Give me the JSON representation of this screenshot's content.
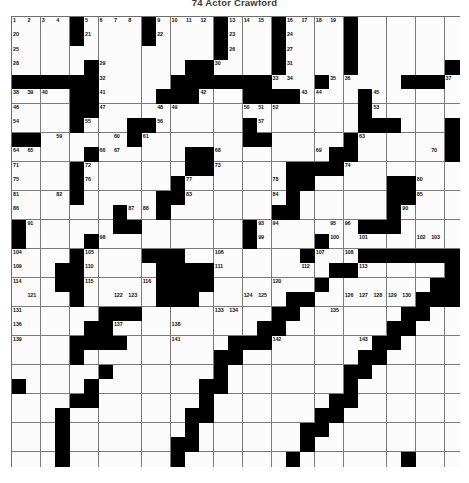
{
  "puzzle": {
    "title": "74  Actor Crawford",
    "type": "crossword-grid",
    "columns": 31,
    "rows": 31,
    "colors": {
      "block": "#000000",
      "cell": "#fbfbfb",
      "grid_line": "#7a7a7a",
      "number_text": "#111111",
      "page_background": "#ffffff"
    },
    "black_cells": [
      [
        0,
        4
      ],
      [
        0,
        9
      ],
      [
        0,
        14
      ],
      [
        0,
        18
      ],
      [
        0,
        23
      ],
      [
        1,
        4
      ],
      [
        1,
        9
      ],
      [
        1,
        14
      ],
      [
        1,
        18
      ],
      [
        1,
        23
      ],
      [
        2,
        14
      ],
      [
        2,
        18
      ],
      [
        2,
        23
      ],
      [
        3,
        5
      ],
      [
        3,
        12
      ],
      [
        3,
        13
      ],
      [
        3,
        18
      ],
      [
        3,
        23
      ],
      [
        3,
        30
      ],
      [
        4,
        0
      ],
      [
        4,
        1
      ],
      [
        4,
        2
      ],
      [
        4,
        3
      ],
      [
        4,
        4
      ],
      [
        4,
        5
      ],
      [
        4,
        11
      ],
      [
        4,
        12
      ],
      [
        4,
        13
      ],
      [
        4,
        14
      ],
      [
        4,
        15
      ],
      [
        4,
        16
      ],
      [
        4,
        17
      ],
      [
        4,
        21
      ],
      [
        4,
        27
      ],
      [
        4,
        28
      ],
      [
        4,
        29
      ],
      [
        5,
        4
      ],
      [
        5,
        5
      ],
      [
        5,
        10
      ],
      [
        5,
        11
      ],
      [
        5,
        12
      ],
      [
        5,
        16
      ],
      [
        5,
        17
      ],
      [
        5,
        18
      ],
      [
        5,
        19
      ],
      [
        5,
        24
      ],
      [
        6,
        4
      ],
      [
        6,
        5
      ],
      [
        6,
        24
      ],
      [
        7,
        4
      ],
      [
        7,
        8
      ],
      [
        7,
        9
      ],
      [
        7,
        16
      ],
      [
        7,
        24
      ],
      [
        7,
        25
      ],
      [
        7,
        26
      ],
      [
        7,
        30
      ],
      [
        8,
        0
      ],
      [
        8,
        1
      ],
      [
        8,
        8
      ],
      [
        8,
        16
      ],
      [
        8,
        17
      ],
      [
        8,
        23
      ],
      [
        8,
        30
      ],
      [
        9,
        5
      ],
      [
        9,
        12
      ],
      [
        9,
        13
      ],
      [
        9,
        22
      ],
      [
        9,
        23
      ],
      [
        9,
        30
      ],
      [
        10,
        4
      ],
      [
        10,
        12
      ],
      [
        10,
        13
      ],
      [
        10,
        19
      ],
      [
        10,
        20
      ],
      [
        10,
        21
      ],
      [
        10,
        22
      ],
      [
        11,
        4
      ],
      [
        11,
        11
      ],
      [
        11,
        19
      ],
      [
        11,
        20
      ],
      [
        11,
        26
      ],
      [
        11,
        27
      ],
      [
        12,
        4
      ],
      [
        12,
        10
      ],
      [
        12,
        11
      ],
      [
        12,
        19
      ],
      [
        12,
        26
      ],
      [
        12,
        27
      ],
      [
        13,
        7
      ],
      [
        13,
        10
      ],
      [
        13,
        18
      ],
      [
        13,
        19
      ],
      [
        13,
        26
      ],
      [
        14,
        0
      ],
      [
        14,
        7
      ],
      [
        14,
        8
      ],
      [
        14,
        16
      ],
      [
        14,
        24
      ],
      [
        14,
        25
      ],
      [
        14,
        26
      ],
      [
        15,
        0
      ],
      [
        15,
        5
      ],
      [
        15,
        16
      ],
      [
        15,
        21
      ],
      [
        16,
        4
      ],
      [
        16,
        9
      ],
      [
        16,
        10
      ],
      [
        16,
        11
      ],
      [
        16,
        20
      ],
      [
        16,
        24
      ],
      [
        16,
        25
      ],
      [
        16,
        26
      ],
      [
        16,
        27
      ],
      [
        16,
        28
      ],
      [
        16,
        29
      ],
      [
        16,
        30
      ],
      [
        17,
        3
      ],
      [
        17,
        4
      ],
      [
        17,
        10
      ],
      [
        17,
        11
      ],
      [
        17,
        12
      ],
      [
        17,
        13
      ],
      [
        17,
        22
      ],
      [
        17,
        23
      ],
      [
        17,
        30
      ],
      [
        18,
        3
      ],
      [
        18,
        4
      ],
      [
        18,
        10
      ],
      [
        18,
        11
      ],
      [
        18,
        12
      ],
      [
        18,
        13
      ],
      [
        18,
        21
      ],
      [
        18,
        29
      ],
      [
        18,
        30
      ],
      [
        19,
        4
      ],
      [
        19,
        10
      ],
      [
        19,
        11
      ],
      [
        19,
        12
      ],
      [
        19,
        19
      ],
      [
        19,
        20
      ],
      [
        19,
        28
      ],
      [
        19,
        29
      ],
      [
        19,
        30
      ],
      [
        20,
        6
      ],
      [
        20,
        7
      ],
      [
        20,
        8
      ],
      [
        20,
        18
      ],
      [
        20,
        19
      ],
      [
        20,
        27
      ],
      [
        20,
        28
      ],
      [
        21,
        5
      ],
      [
        21,
        6
      ],
      [
        21,
        17
      ],
      [
        21,
        18
      ],
      [
        21,
        26
      ],
      [
        21,
        27
      ],
      [
        22,
        4
      ],
      [
        22,
        5
      ],
      [
        22,
        6
      ],
      [
        22,
        7
      ],
      [
        22,
        15
      ],
      [
        22,
        16
      ],
      [
        22,
        17
      ],
      [
        22,
        25
      ],
      [
        22,
        26
      ],
      [
        23,
        4
      ],
      [
        23,
        14
      ],
      [
        23,
        15
      ],
      [
        23,
        24
      ],
      [
        23,
        25
      ],
      [
        24,
        6
      ],
      [
        24,
        14
      ],
      [
        24,
        23
      ],
      [
        24,
        24
      ],
      [
        25,
        0
      ],
      [
        25,
        5
      ],
      [
        25,
        13
      ],
      [
        25,
        14
      ],
      [
        25,
        23
      ],
      [
        26,
        4
      ],
      [
        26,
        5
      ],
      [
        26,
        13
      ],
      [
        26,
        22
      ],
      [
        26,
        23
      ],
      [
        27,
        3
      ],
      [
        27,
        12
      ],
      [
        27,
        13
      ],
      [
        27,
        21
      ],
      [
        27,
        22
      ],
      [
        28,
        3
      ],
      [
        28,
        12
      ],
      [
        28,
        20
      ],
      [
        28,
        21
      ],
      [
        29,
        3
      ],
      [
        29,
        11
      ],
      [
        29,
        12
      ],
      [
        29,
        20
      ],
      [
        30,
        3
      ],
      [
        30,
        11
      ],
      [
        30,
        19
      ],
      [
        30,
        27
      ]
    ],
    "numbered_cells": [
      {
        "n": 1,
        "r": 0,
        "c": 0
      },
      {
        "n": 2,
        "r": 0,
        "c": 1
      },
      {
        "n": 3,
        "r": 0,
        "c": 2
      },
      {
        "n": 4,
        "r": 0,
        "c": 3
      },
      {
        "n": 5,
        "r": 0,
        "c": 5
      },
      {
        "n": 6,
        "r": 0,
        "c": 6
      },
      {
        "n": 7,
        "r": 0,
        "c": 7
      },
      {
        "n": 8,
        "r": 0,
        "c": 8
      },
      {
        "n": 9,
        "r": 0,
        "c": 10
      },
      {
        "n": 10,
        "r": 0,
        "c": 11
      },
      {
        "n": 11,
        "r": 0,
        "c": 12
      },
      {
        "n": 12,
        "r": 0,
        "c": 13
      },
      {
        "n": 13,
        "r": 0,
        "c": 15
      },
      {
        "n": 14,
        "r": 0,
        "c": 16
      },
      {
        "n": 15,
        "r": 0,
        "c": 17
      },
      {
        "n": 16,
        "r": 0,
        "c": 19
      },
      {
        "n": 17,
        "r": 0,
        "c": 20
      },
      {
        "n": 18,
        "r": 0,
        "c": 21
      },
      {
        "n": 19,
        "r": 0,
        "c": 22
      },
      {
        "n": 20,
        "r": 1,
        "c": 0
      },
      {
        "n": 21,
        "r": 1,
        "c": 5
      },
      {
        "n": 22,
        "r": 1,
        "c": 10
      },
      {
        "n": 23,
        "r": 1,
        "c": 15
      },
      {
        "n": 24,
        "r": 1,
        "c": 19
      },
      {
        "n": 25,
        "r": 2,
        "c": 0
      },
      {
        "n": 26,
        "r": 2,
        "c": 15
      },
      {
        "n": 27,
        "r": 2,
        "c": 19
      },
      {
        "n": 28,
        "r": 3,
        "c": 0
      },
      {
        "n": 29,
        "r": 3,
        "c": 6
      },
      {
        "n": 30,
        "r": 3,
        "c": 14
      },
      {
        "n": 31,
        "r": 3,
        "c": 19
      },
      {
        "n": 32,
        "r": 4,
        "c": 6
      },
      {
        "n": 33,
        "r": 4,
        "c": 18
      },
      {
        "n": 34,
        "r": 4,
        "c": 19
      },
      {
        "n": 35,
        "r": 4,
        "c": 22
      },
      {
        "n": 36,
        "r": 4,
        "c": 23
      },
      {
        "n": 37,
        "r": 4,
        "c": 30
      },
      {
        "n": 38,
        "r": 5,
        "c": 0
      },
      {
        "n": 39,
        "r": 5,
        "c": 1
      },
      {
        "n": 40,
        "r": 5,
        "c": 2
      },
      {
        "n": 41,
        "r": 5,
        "c": 6
      },
      {
        "n": 42,
        "r": 5,
        "c": 13
      },
      {
        "n": 43,
        "r": 5,
        "c": 20
      },
      {
        "n": 44,
        "r": 5,
        "c": 21
      },
      {
        "n": 45,
        "r": 5,
        "c": 25
      },
      {
        "n": 46,
        "r": 6,
        "c": 0
      },
      {
        "n": 47,
        "r": 6,
        "c": 6
      },
      {
        "n": 48,
        "r": 6,
        "c": 10
      },
      {
        "n": 49,
        "r": 6,
        "c": 11
      },
      {
        "n": 50,
        "r": 6,
        "c": 16
      },
      {
        "n": 51,
        "r": 6,
        "c": 17
      },
      {
        "n": 52,
        "r": 6,
        "c": 18
      },
      {
        "n": 53,
        "r": 6,
        "c": 25
      },
      {
        "n": 54,
        "r": 7,
        "c": 0
      },
      {
        "n": 55,
        "r": 7,
        "c": 5
      },
      {
        "n": 56,
        "r": 7,
        "c": 10
      },
      {
        "n": 57,
        "r": 7,
        "c": 17
      },
      {
        "n": 58,
        "r": 7,
        "c": 25
      },
      {
        "n": 59,
        "r": 8,
        "c": 3
      },
      {
        "n": 60,
        "r": 8,
        "c": 7
      },
      {
        "n": 61,
        "r": 8,
        "c": 9
      },
      {
        "n": 62,
        "r": 8,
        "c": 17
      },
      {
        "n": 63,
        "r": 8,
        "c": 24
      },
      {
        "n": 64,
        "r": 9,
        "c": 0
      },
      {
        "n": 65,
        "r": 9,
        "c": 1
      },
      {
        "n": 66,
        "r": 9,
        "c": 6
      },
      {
        "n": 67,
        "r": 9,
        "c": 7
      },
      {
        "n": 68,
        "r": 9,
        "c": 14
      },
      {
        "n": 69,
        "r": 9,
        "c": 21
      },
      {
        "n": 70,
        "r": 9,
        "c": 29
      },
      {
        "n": 71,
        "r": 10,
        "c": 0
      },
      {
        "n": 72,
        "r": 10,
        "c": 5
      },
      {
        "n": 73,
        "r": 10,
        "c": 14
      },
      {
        "n": 74,
        "r": 10,
        "c": 23
      },
      {
        "n": 75,
        "r": 11,
        "c": 0
      },
      {
        "n": 76,
        "r": 11,
        "c": 5
      },
      {
        "n": 77,
        "r": 11,
        "c": 12
      },
      {
        "n": 78,
        "r": 11,
        "c": 18
      },
      {
        "n": 79,
        "r": 11,
        "c": 19
      },
      {
        "n": 80,
        "r": 11,
        "c": 28
      },
      {
        "n": 81,
        "r": 12,
        "c": 0
      },
      {
        "n": 82,
        "r": 12,
        "c": 3
      },
      {
        "n": 83,
        "r": 12,
        "c": 12
      },
      {
        "n": 84,
        "r": 12,
        "c": 18
      },
      {
        "n": 85,
        "r": 12,
        "c": 28
      },
      {
        "n": 86,
        "r": 13,
        "c": 0
      },
      {
        "n": 87,
        "r": 13,
        "c": 8
      },
      {
        "n": 88,
        "r": 13,
        "c": 9
      },
      {
        "n": 89,
        "r": 13,
        "c": 18
      },
      {
        "n": 90,
        "r": 13,
        "c": 27
      },
      {
        "n": 91,
        "r": 14,
        "c": 1
      },
      {
        "n": 92,
        "r": 14,
        "c": 8
      },
      {
        "n": 93,
        "r": 14,
        "c": 17
      },
      {
        "n": 94,
        "r": 14,
        "c": 18
      },
      {
        "n": 95,
        "r": 14,
        "c": 22
      },
      {
        "n": 96,
        "r": 14,
        "c": 23
      },
      {
        "n": 97,
        "r": 15,
        "c": 0
      },
      {
        "n": 98,
        "r": 15,
        "c": 6
      },
      {
        "n": 99,
        "r": 15,
        "c": 17
      },
      {
        "n": 100,
        "r": 15,
        "c": 22
      },
      {
        "n": 101,
        "r": 15,
        "c": 24
      },
      {
        "n": 102,
        "r": 15,
        "c": 28
      },
      {
        "n": 103,
        "r": 15,
        "c": 29
      },
      {
        "n": 104,
        "r": 16,
        "c": 0
      },
      {
        "n": 105,
        "r": 16,
        "c": 5
      },
      {
        "n": 106,
        "r": 16,
        "c": 14
      },
      {
        "n": 107,
        "r": 16,
        "c": 21
      },
      {
        "n": 108,
        "r": 16,
        "c": 23
      },
      {
        "n": 109,
        "r": 17,
        "c": 0
      },
      {
        "n": 110,
        "r": 17,
        "c": 5
      },
      {
        "n": 111,
        "r": 17,
        "c": 14
      },
      {
        "n": 112,
        "r": 17,
        "c": 20
      },
      {
        "n": 113,
        "r": 17,
        "c": 24
      },
      {
        "n": 114,
        "r": 18,
        "c": 0
      },
      {
        "n": 115,
        "r": 18,
        "c": 5
      },
      {
        "n": 116,
        "r": 18,
        "c": 9
      },
      {
        "n": 117,
        "r": 18,
        "c": 10
      },
      {
        "n": 118,
        "r": 18,
        "c": 11
      },
      {
        "n": 119,
        "r": 18,
        "c": 12
      },
      {
        "n": 120,
        "r": 18,
        "c": 18
      },
      {
        "n": 121,
        "r": 19,
        "c": 1
      },
      {
        "n": 122,
        "r": 19,
        "c": 7
      },
      {
        "n": 123,
        "r": 19,
        "c": 8
      },
      {
        "n": 124,
        "r": 19,
        "c": 16
      },
      {
        "n": 125,
        "r": 19,
        "c": 17
      },
      {
        "n": 126,
        "r": 19,
        "c": 23
      },
      {
        "n": 127,
        "r": 19,
        "c": 24
      },
      {
        "n": 128,
        "r": 19,
        "c": 25
      },
      {
        "n": 129,
        "r": 19,
        "c": 26
      },
      {
        "n": 130,
        "r": 19,
        "c": 27
      },
      {
        "n": 131,
        "r": 20,
        "c": 0
      },
      {
        "n": 132,
        "r": 20,
        "c": 7
      },
      {
        "n": 133,
        "r": 20,
        "c": 14
      },
      {
        "n": 134,
        "r": 20,
        "c": 15
      },
      {
        "n": 135,
        "r": 20,
        "c": 22
      },
      {
        "n": 136,
        "r": 21,
        "c": 0
      },
      {
        "n": 137,
        "r": 21,
        "c": 7
      },
      {
        "n": 138,
        "r": 21,
        "c": 11
      },
      {
        "n": 139,
        "r": 22,
        "c": 0
      },
      {
        "n": 140,
        "r": 22,
        "c": 7
      },
      {
        "n": 141,
        "r": 22,
        "c": 11
      },
      {
        "n": 142,
        "r": 22,
        "c": 18
      },
      {
        "n": 143,
        "r": 22,
        "c": 24
      }
    ]
  }
}
